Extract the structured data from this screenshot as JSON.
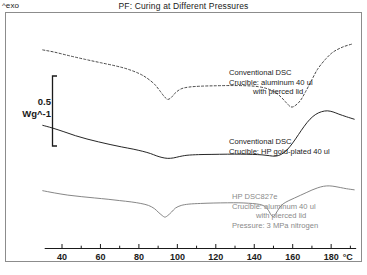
{
  "header": {
    "exo_label": "^exo",
    "title": "PF: Curing at Different Pressures"
  },
  "yaxis": {
    "scale_value": "0.5",
    "scale_unit": "Wg^-1"
  },
  "xaxis": {
    "unit": "°C",
    "ticks": [
      "40",
      "60",
      "80",
      "100",
      "120",
      "140",
      "160",
      "180"
    ]
  },
  "annotations": {
    "conventional_dsc_aluminum": {
      "line1": "Conventional DSC",
      "line2": "Crucible:  aluminum 40 ul",
      "line3": "with pierced lid"
    },
    "conventional_dsc_gold": {
      "line1": "Conventional DSC",
      "line2": "Crucible: HP gold-plated 40 ul"
    },
    "hp_dsc827e": {
      "line1": "HP DSC827e",
      "line2": "Crucible: aluminum 40 ul",
      "line3": "with pierced lid",
      "line4": "Pressure: 3 MPa nitrogen"
    }
  },
  "chart_data": {
    "type": "line",
    "title": "PF: Curing at Different Pressures",
    "xlabel": "°C",
    "ylabel": "Wg^-1",
    "xlim": [
      28,
      195
    ],
    "xticks": [
      40,
      60,
      80,
      100,
      120,
      140,
      160,
      180
    ],
    "minor_tick_step": 10,
    "grid": false,
    "legend": "inline-annotations",
    "y_scale_bar": {
      "value": 0.5,
      "unit": "Wg^-1"
    },
    "series": [
      {
        "name": "Conventional DSC, aluminum 40 ul with pierced lid",
        "style": "dashed",
        "color": "#333333",
        "points": [
          [
            30,
            0.855
          ],
          [
            36,
            0.845
          ],
          [
            44,
            0.828
          ],
          [
            52,
            0.812
          ],
          [
            60,
            0.797
          ],
          [
            68,
            0.782
          ],
          [
            74,
            0.768
          ],
          [
            80,
            0.748
          ],
          [
            84,
            0.728
          ],
          [
            88,
            0.7
          ],
          [
            91,
            0.668
          ],
          [
            93,
            0.645
          ],
          [
            95,
            0.63
          ],
          [
            97,
            0.64
          ],
          [
            99,
            0.66
          ],
          [
            102,
            0.678
          ],
          [
            106,
            0.686
          ],
          [
            112,
            0.69
          ],
          [
            120,
            0.692
          ],
          [
            128,
            0.693
          ],
          [
            136,
            0.692
          ],
          [
            142,
            0.688
          ],
          [
            147,
            0.678
          ],
          [
            151,
            0.662
          ],
          [
            154,
            0.64
          ],
          [
            157,
            0.612
          ],
          [
            159,
            0.596
          ],
          [
            161,
            0.6
          ],
          [
            164,
            0.625
          ],
          [
            167,
            0.67
          ],
          [
            170,
            0.72
          ],
          [
            173,
            0.768
          ],
          [
            177,
            0.812
          ],
          [
            181,
            0.845
          ],
          [
            186,
            0.868
          ],
          [
            191,
            0.882
          ]
        ]
      },
      {
        "name": "Conventional DSC, HP gold-plated 40 ul",
        "style": "solid",
        "color": "#1a1a1a",
        "points": [
          [
            30,
            0.512
          ],
          [
            35,
            0.5
          ],
          [
            41,
            0.483
          ],
          [
            47,
            0.465
          ],
          [
            53,
            0.45
          ],
          [
            59,
            0.437
          ],
          [
            65,
            0.425
          ],
          [
            71,
            0.414
          ],
          [
            77,
            0.404
          ],
          [
            82,
            0.394
          ],
          [
            86,
            0.384
          ],
          [
            89,
            0.374
          ],
          [
            92,
            0.366
          ],
          [
            95,
            0.362
          ],
          [
            98,
            0.364
          ],
          [
            101,
            0.37
          ],
          [
            105,
            0.376
          ],
          [
            111,
            0.379
          ],
          [
            118,
            0.38
          ],
          [
            126,
            0.381
          ],
          [
            133,
            0.381
          ],
          [
            139,
            0.38
          ],
          [
            144,
            0.378
          ],
          [
            148,
            0.374
          ],
          [
            151,
            0.372
          ],
          [
            154,
            0.38
          ],
          [
            157,
            0.4
          ],
          [
            160,
            0.432
          ],
          [
            163,
            0.47
          ],
          [
            166,
            0.508
          ],
          [
            169,
            0.54
          ],
          [
            172,
            0.562
          ],
          [
            175,
            0.574
          ],
          [
            178,
            0.578
          ],
          [
            181,
            0.573
          ],
          [
            184,
            0.563
          ],
          [
            188,
            0.551
          ],
          [
            192,
            0.54
          ]
        ]
      },
      {
        "name": "HP DSC827e, aluminum 40 ul with pierced lid, 3 MPa nitrogen",
        "style": "solid",
        "color": "#808080",
        "points": [
          [
            30,
            0.215
          ],
          [
            36,
            0.205
          ],
          [
            43,
            0.195
          ],
          [
            50,
            0.188
          ],
          [
            57,
            0.182
          ],
          [
            64,
            0.176
          ],
          [
            70,
            0.17
          ],
          [
            76,
            0.164
          ],
          [
            81,
            0.157
          ],
          [
            85,
            0.148
          ],
          [
            88,
            0.134
          ],
          [
            90,
            0.118
          ],
          [
            92,
            0.103
          ],
          [
            93.5,
            0.095
          ],
          [
            95,
            0.102
          ],
          [
            97,
            0.118
          ],
          [
            99,
            0.136
          ],
          [
            102,
            0.148
          ],
          [
            106,
            0.154
          ],
          [
            112,
            0.157
          ],
          [
            119,
            0.159
          ],
          [
            126,
            0.16
          ],
          [
            132,
            0.16
          ],
          [
            137,
            0.158
          ],
          [
            141,
            0.155
          ],
          [
            144,
            0.15
          ],
          [
            146,
            0.14
          ],
          [
            147.5,
            0.124
          ],
          [
            148.8,
            0.104
          ],
          [
            150,
            0.098
          ],
          [
            151.3,
            0.112
          ],
          [
            153,
            0.136
          ],
          [
            155,
            0.155
          ],
          [
            158,
            0.17
          ],
          [
            161,
            0.182
          ],
          [
            164,
            0.194
          ],
          [
            167,
            0.206
          ],
          [
            170,
            0.218
          ],
          [
            173,
            0.228
          ],
          [
            176,
            0.235
          ],
          [
            179,
            0.237
          ],
          [
            182,
            0.234
          ],
          [
            185,
            0.229
          ],
          [
            188,
            0.224
          ],
          [
            192,
            0.219
          ]
        ]
      }
    ]
  }
}
